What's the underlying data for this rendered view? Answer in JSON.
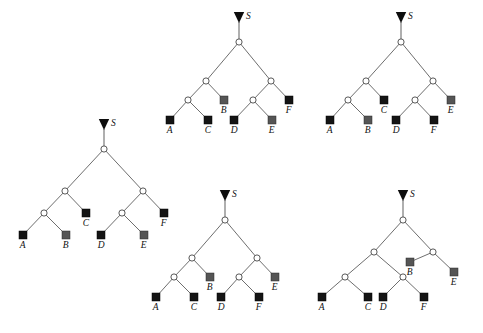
{
  "figure": {
    "title": "",
    "background": "#ffffff",
    "width": 483,
    "height": 333,
    "colors": {
      "branch": "#6e6e6e",
      "internal_node_fill": "#ffffff",
      "internal_node_stroke": "#595959",
      "leaf_black": "#141414",
      "leaf_gray": "#555555",
      "root_marker": "#0d0d0d",
      "label": "#111111"
    },
    "root_marker_label": "S",
    "root_marker_shape": "down-triangle",
    "internal_node_shape": "open-circle",
    "leaf_shape": "square"
  },
  "trees": [
    {
      "id": "tree-top-middle",
      "name": "tree-top-middle",
      "root_label": "S",
      "origin": [
        158,
        8
      ],
      "root": [
        81,
        34
      ],
      "stem_top": [
        81,
        14
      ],
      "internals": [
        {
          "name": "n0",
          "x": 81,
          "y": 34
        },
        {
          "name": "n1",
          "x": 48,
          "y": 73
        },
        {
          "name": "n2",
          "x": 113,
          "y": 73
        },
        {
          "name": "n3",
          "x": 30,
          "y": 92
        },
        {
          "name": "n4",
          "x": 95,
          "y": 92
        }
      ],
      "leaves": [
        {
          "label": "A",
          "x": 12,
          "y": 112,
          "color": "black"
        },
        {
          "label": "C",
          "x": 50,
          "y": 112,
          "color": "black"
        },
        {
          "label": "B",
          "x": 66,
          "y": 92,
          "color": "gray"
        },
        {
          "label": "D",
          "x": 76,
          "y": 112,
          "color": "black"
        },
        {
          "label": "E",
          "x": 114,
          "y": 112,
          "color": "gray"
        },
        {
          "label": "F",
          "x": 131,
          "y": 92,
          "color": "black"
        }
      ],
      "edges": [
        [
          "n0",
          "n1"
        ],
        [
          "n0",
          "n2"
        ],
        [
          "n1",
          "n3"
        ],
        [
          "n1",
          "B"
        ],
        [
          "n3",
          "A"
        ],
        [
          "n3",
          "C"
        ],
        [
          "n2",
          "n4"
        ],
        [
          "n2",
          "F"
        ],
        [
          "n4",
          "D"
        ],
        [
          "n4",
          "E"
        ]
      ]
    },
    {
      "id": "tree-top-right",
      "name": "tree-top-right",
      "root_label": "S",
      "origin": [
        315,
        8
      ],
      "root": [
        86,
        34
      ],
      "stem_top": [
        86,
        14
      ],
      "internals": [
        {
          "name": "n0",
          "x": 86,
          "y": 34
        },
        {
          "name": "n1",
          "x": 51,
          "y": 73
        },
        {
          "name": "n2",
          "x": 118,
          "y": 73
        },
        {
          "name": "n3",
          "x": 33,
          "y": 92
        },
        {
          "name": "n4",
          "x": 100,
          "y": 92
        }
      ],
      "leaves": [
        {
          "label": "A",
          "x": 15,
          "y": 112,
          "color": "black"
        },
        {
          "label": "B",
          "x": 53,
          "y": 112,
          "color": "gray"
        },
        {
          "label": "C",
          "x": 69,
          "y": 92,
          "color": "black"
        },
        {
          "label": "D",
          "x": 81,
          "y": 112,
          "color": "black"
        },
        {
          "label": "F",
          "x": 119,
          "y": 112,
          "color": "black"
        },
        {
          "label": "E",
          "x": 136,
          "y": 92,
          "color": "gray"
        }
      ],
      "edges": [
        [
          "n0",
          "n1"
        ],
        [
          "n0",
          "n2"
        ],
        [
          "n1",
          "n3"
        ],
        [
          "n1",
          "C"
        ],
        [
          "n3",
          "A"
        ],
        [
          "n3",
          "B"
        ],
        [
          "n2",
          "n4"
        ],
        [
          "n2",
          "E"
        ],
        [
          "n4",
          "D"
        ],
        [
          "n4",
          "F"
        ]
      ]
    },
    {
      "id": "tree-left",
      "name": "tree-left",
      "root_label": "S",
      "origin": [
        8,
        115
      ],
      "root": [
        96,
        34
      ],
      "stem_top": [
        96,
        14
      ],
      "internals": [
        {
          "name": "n0",
          "x": 96,
          "y": 34
        },
        {
          "name": "n1",
          "x": 57,
          "y": 76
        },
        {
          "name": "n2",
          "x": 135,
          "y": 76
        },
        {
          "name": "n3",
          "x": 36,
          "y": 98
        },
        {
          "name": "n4",
          "x": 114,
          "y": 98
        }
      ],
      "leaves": [
        {
          "label": "A",
          "x": 15,
          "y": 120,
          "color": "black"
        },
        {
          "label": "B",
          "x": 58,
          "y": 120,
          "color": "gray"
        },
        {
          "label": "C",
          "x": 78,
          "y": 98,
          "color": "black"
        },
        {
          "label": "D",
          "x": 93,
          "y": 120,
          "color": "black"
        },
        {
          "label": "E",
          "x": 136,
          "y": 120,
          "color": "gray"
        },
        {
          "label": "F",
          "x": 156,
          "y": 98,
          "color": "black"
        }
      ],
      "edges": [
        [
          "n0",
          "n1"
        ],
        [
          "n0",
          "n2"
        ],
        [
          "n1",
          "n3"
        ],
        [
          "n1",
          "C"
        ],
        [
          "n3",
          "A"
        ],
        [
          "n3",
          "B"
        ],
        [
          "n2",
          "n4"
        ],
        [
          "n2",
          "F"
        ],
        [
          "n4",
          "D"
        ],
        [
          "n4",
          "E"
        ]
      ]
    },
    {
      "id": "tree-bottom-middle",
      "name": "tree-bottom-middle",
      "root_label": "S",
      "origin": [
        160,
        186
      ],
      "root": [
        65,
        34
      ],
      "stem_top": [
        65,
        14
      ],
      "internals": [
        {
          "name": "n0",
          "x": 65,
          "y": 34
        },
        {
          "name": "n1",
          "x": 32,
          "y": 72
        },
        {
          "name": "n2",
          "x": 97,
          "y": 72
        },
        {
          "name": "n3",
          "x": 14,
          "y": 91
        },
        {
          "name": "n4",
          "x": 79,
          "y": 91
        }
      ],
      "leaves": [
        {
          "label": "A",
          "x": -4,
          "y": 111,
          "color": "black"
        },
        {
          "label": "C",
          "x": 34,
          "y": 111,
          "color": "black"
        },
        {
          "label": "B",
          "x": 50,
          "y": 91,
          "color": "gray"
        },
        {
          "label": "D",
          "x": 61,
          "y": 111,
          "color": "black"
        },
        {
          "label": "F",
          "x": 99,
          "y": 111,
          "color": "black"
        },
        {
          "label": "E",
          "x": 115,
          "y": 91,
          "color": "gray"
        }
      ],
      "edges": [
        [
          "n0",
          "n1"
        ],
        [
          "n0",
          "n2"
        ],
        [
          "n1",
          "n3"
        ],
        [
          "n1",
          "B"
        ],
        [
          "n3",
          "A"
        ],
        [
          "n3",
          "C"
        ],
        [
          "n2",
          "n4"
        ],
        [
          "n2",
          "E"
        ],
        [
          "n4",
          "D"
        ],
        [
          "n4",
          "F"
        ]
      ]
    },
    {
      "id": "tree-bottom-right",
      "name": "tree-bottom-right",
      "root_label": "S",
      "origin": [
        320,
        186
      ],
      "root": [
        83,
        34
      ],
      "stem_top": [
        83,
        14
      ],
      "internals": [
        {
          "name": "n0",
          "x": 83,
          "y": 34
        },
        {
          "name": "n1",
          "x": 54,
          "y": 66
        },
        {
          "name": "n2",
          "x": 113,
          "y": 66
        },
        {
          "name": "n3",
          "x": 25,
          "y": 91
        },
        {
          "name": "n4",
          "x": 83,
          "y": 91
        }
      ],
      "leaves": [
        {
          "label": "A",
          "x": 2,
          "y": 111,
          "color": "black"
        },
        {
          "label": "C",
          "x": 48,
          "y": 111,
          "color": "black"
        },
        {
          "label": "D",
          "x": 63,
          "y": 111,
          "color": "black"
        },
        {
          "label": "F",
          "x": 104,
          "y": 111,
          "color": "black"
        },
        {
          "label": "B",
          "x": 90,
          "y": 76,
          "color": "gray"
        },
        {
          "label": "E",
          "x": 134,
          "y": 86,
          "color": "gray"
        }
      ],
      "edges": [
        [
          "n0",
          "n1"
        ],
        [
          "n0",
          "n2"
        ],
        [
          "n1",
          "n3"
        ],
        [
          "n1",
          "n4"
        ],
        [
          "n3",
          "A"
        ],
        [
          "n3",
          "C"
        ],
        [
          "n4",
          "D"
        ],
        [
          "n4",
          "F"
        ],
        [
          "n2",
          "B"
        ],
        [
          "n2",
          "E"
        ]
      ]
    }
  ]
}
